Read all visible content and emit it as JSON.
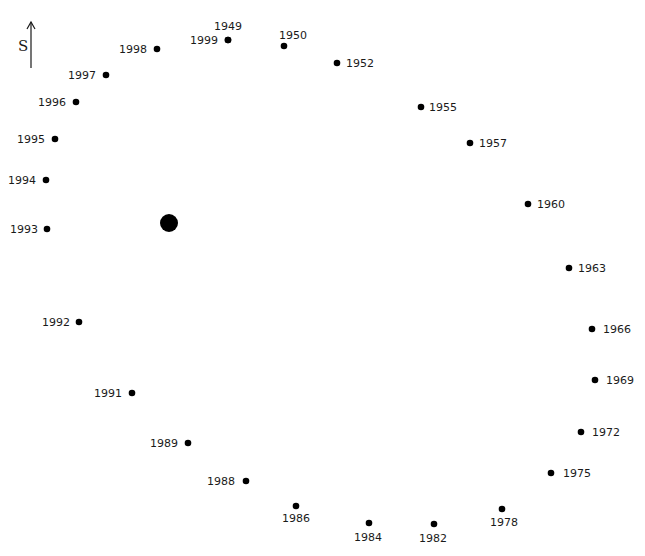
{
  "direction_indicator": {
    "label": "S",
    "icon": "arrow-up-icon"
  },
  "center_marker": {
    "x": 169,
    "y": 223,
    "r": 9
  },
  "chart_data": {
    "type": "scatter",
    "title": "",
    "points": [
      {
        "year": "1949",
        "x": 228,
        "y": 40,
        "lx": 228,
        "ly": 30,
        "anchor": "middle"
      },
      {
        "year": "1999",
        "x": 228,
        "y": 40,
        "lx": 218,
        "ly": 44,
        "anchor": "end"
      },
      {
        "year": "1950",
        "x": 284,
        "y": 46,
        "lx": 293,
        "ly": 39,
        "anchor": "middle"
      },
      {
        "year": "1952",
        "x": 337,
        "y": 63,
        "lx": 346,
        "ly": 67,
        "anchor": "start"
      },
      {
        "year": "1955",
        "x": 421,
        "y": 107,
        "lx": 429,
        "ly": 111,
        "anchor": "start"
      },
      {
        "year": "1957",
        "x": 470,
        "y": 143,
        "lx": 479,
        "ly": 147,
        "anchor": "start"
      },
      {
        "year": "1960",
        "x": 528,
        "y": 204,
        "lx": 537,
        "ly": 208,
        "anchor": "start"
      },
      {
        "year": "1963",
        "x": 569,
        "y": 268,
        "lx": 578,
        "ly": 272,
        "anchor": "start"
      },
      {
        "year": "1966",
        "x": 592,
        "y": 329,
        "lx": 603,
        "ly": 333,
        "anchor": "start"
      },
      {
        "year": "1969",
        "x": 595,
        "y": 380,
        "lx": 606,
        "ly": 384,
        "anchor": "start"
      },
      {
        "year": "1972",
        "x": 581,
        "y": 432,
        "lx": 592,
        "ly": 436,
        "anchor": "start"
      },
      {
        "year": "1975",
        "x": 551,
        "y": 473,
        "lx": 563,
        "ly": 477,
        "anchor": "start"
      },
      {
        "year": "1978",
        "x": 502,
        "y": 509,
        "lx": 504,
        "ly": 526,
        "anchor": "middle"
      },
      {
        "year": "1982",
        "x": 434,
        "y": 524,
        "lx": 433,
        "ly": 542,
        "anchor": "middle"
      },
      {
        "year": "1984",
        "x": 369,
        "y": 523,
        "lx": 368,
        "ly": 541,
        "anchor": "middle"
      },
      {
        "year": "1986",
        "x": 296,
        "y": 506,
        "lx": 296,
        "ly": 522,
        "anchor": "middle"
      },
      {
        "year": "1988",
        "x": 246,
        "y": 481,
        "lx": 235,
        "ly": 485,
        "anchor": "end"
      },
      {
        "year": "1989",
        "x": 188,
        "y": 443,
        "lx": 178,
        "ly": 447,
        "anchor": "end"
      },
      {
        "year": "1991",
        "x": 132,
        "y": 393,
        "lx": 122,
        "ly": 397,
        "anchor": "end"
      },
      {
        "year": "1992",
        "x": 79,
        "y": 322,
        "lx": 70,
        "ly": 326,
        "anchor": "end"
      },
      {
        "year": "1993",
        "x": 47,
        "y": 229,
        "lx": 38,
        "ly": 233,
        "anchor": "end"
      },
      {
        "year": "1994",
        "x": 46,
        "y": 180,
        "lx": 36,
        "ly": 184,
        "anchor": "end"
      },
      {
        "year": "1995",
        "x": 55,
        "y": 139,
        "lx": 45,
        "ly": 143,
        "anchor": "end"
      },
      {
        "year": "1996",
        "x": 76,
        "y": 102,
        "lx": 66,
        "ly": 106,
        "anchor": "end"
      },
      {
        "year": "1997",
        "x": 106,
        "y": 75,
        "lx": 96,
        "ly": 79,
        "anchor": "end"
      },
      {
        "year": "1998",
        "x": 157,
        "y": 49,
        "lx": 147,
        "ly": 53,
        "anchor": "end"
      }
    ],
    "xlabel": "",
    "ylabel": "",
    "grid": false,
    "legend": null
  }
}
